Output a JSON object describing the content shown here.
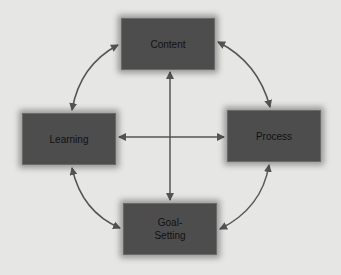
{
  "diagram": {
    "nodes": {
      "top": {
        "label": "Content"
      },
      "left": {
        "label": "Learning"
      },
      "right": {
        "label": "Process"
      },
      "bottom": {
        "label_line1": "Goal-",
        "label_line2": "Setting"
      }
    },
    "edges": [
      {
        "from": "Content",
        "to": "Learning",
        "type": "bidirectional-curve"
      },
      {
        "from": "Content",
        "to": "Process",
        "type": "bidirectional-curve"
      },
      {
        "from": "Learning",
        "to": "Goal-Setting",
        "type": "bidirectional-curve"
      },
      {
        "from": "Process",
        "to": "Goal-Setting",
        "type": "bidirectional-curve"
      },
      {
        "from": "Content",
        "to": "Goal-Setting",
        "type": "bidirectional-straight"
      },
      {
        "from": "Learning",
        "to": "Process",
        "type": "bidirectional-straight"
      }
    ],
    "colors": {
      "node_fill": "#4d4d4d",
      "arrow": "#555555",
      "background": "#e6e6e4"
    }
  }
}
